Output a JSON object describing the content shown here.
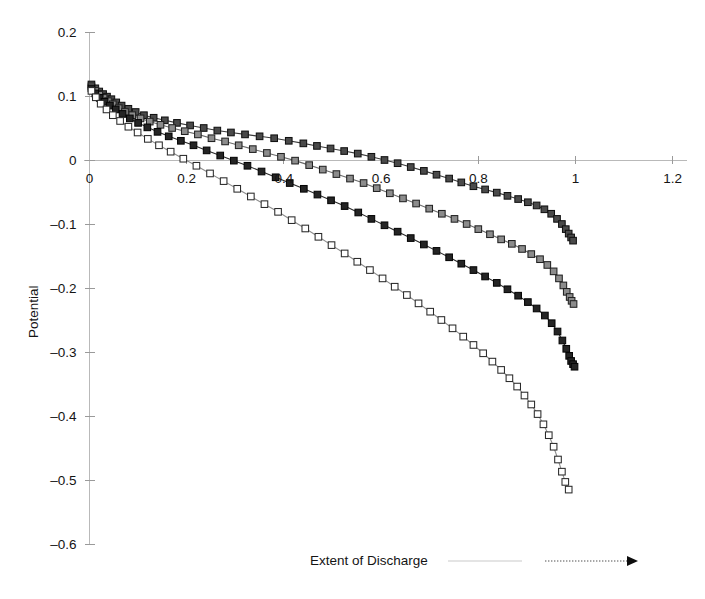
{
  "figure": {
    "background": "#ffffff",
    "axis_color": "#b9b9b9",
    "text_color": "#141414"
  },
  "axis_titles": {
    "ylabel": "Potential",
    "xlabel_annotation": "Extent of Discharge"
  },
  "chart_data": {
    "type": "line",
    "title": "",
    "xlabel": "Extent of Discharge",
    "ylabel": "Potential",
    "xlim": [
      -0.01,
      1.23
    ],
    "ylim": [
      -0.6,
      0.2
    ],
    "xticks": [
      0,
      0.2,
      0.4,
      0.6,
      0.8,
      1,
      1.2
    ],
    "xticklabels": [
      "0",
      "0.2",
      "0.4",
      "0.6",
      "0.8",
      "1",
      "1.2"
    ],
    "yticks": [
      0.2,
      0.1,
      0,
      -0.1,
      -0.2,
      -0.3,
      -0.4,
      -0.5,
      -0.6
    ],
    "yticklabels": [
      "0.2",
      "0.1",
      "0",
      "-0.1",
      "-0.2",
      "-0.3",
      "-0.4",
      "-0.5",
      "-0.6"
    ],
    "grid": false,
    "legend": null,
    "annotations": [
      {
        "text": "Extent of Discharge",
        "x": 0.48,
        "y": -0.61,
        "type": "axis-annotation"
      },
      {
        "text": "arrow pointing right",
        "type": "arrow",
        "from_x": 0.72,
        "to_x": 1.0,
        "y": -0.615
      }
    ],
    "marker": "square",
    "series": [
      {
        "name": "Series 1",
        "marker_fill": "#4a4a4a",
        "marker_edge": "#111111",
        "line_color": "#3a3a3a",
        "x": [
          0.004,
          0.012,
          0.02,
          0.028,
          0.036,
          0.045,
          0.055,
          0.066,
          0.08,
          0.095,
          0.112,
          0.132,
          0.155,
          0.18,
          0.207,
          0.235,
          0.263,
          0.291,
          0.32,
          0.35,
          0.38,
          0.41,
          0.44,
          0.468,
          0.496,
          0.524,
          0.552,
          0.58,
          0.607,
          0.634,
          0.661,
          0.688,
          0.714,
          0.74,
          0.765,
          0.79,
          0.814,
          0.838,
          0.86,
          0.882,
          0.902,
          0.92,
          0.936,
          0.95,
          0.962,
          0.972,
          0.98,
          0.986,
          0.991,
          0.995
        ],
        "y": [
          0.118,
          0.112,
          0.107,
          0.103,
          0.099,
          0.095,
          0.09,
          0.085,
          0.08,
          0.075,
          0.07,
          0.066,
          0.062,
          0.058,
          0.054,
          0.05,
          0.046,
          0.043,
          0.04,
          0.037,
          0.034,
          0.03,
          0.026,
          0.022,
          0.018,
          0.014,
          0.01,
          0.005,
          0.0,
          -0.005,
          -0.011,
          -0.017,
          -0.023,
          -0.029,
          -0.035,
          -0.041,
          -0.046,
          -0.051,
          -0.056,
          -0.061,
          -0.066,
          -0.071,
          -0.077,
          -0.084,
          -0.092,
          -0.1,
          -0.108,
          -0.115,
          -0.121,
          -0.126
        ]
      },
      {
        "name": "Series 2",
        "marker_fill": "#8c8c8c",
        "marker_edge": "#222222",
        "line_color": "#6a6a6a",
        "x": [
          0.004,
          0.012,
          0.02,
          0.029,
          0.038,
          0.048,
          0.06,
          0.073,
          0.088,
          0.105,
          0.124,
          0.146,
          0.17,
          0.196,
          0.223,
          0.251,
          0.279,
          0.307,
          0.336,
          0.365,
          0.394,
          0.423,
          0.452,
          0.48,
          0.508,
          0.536,
          0.564,
          0.591,
          0.618,
          0.645,
          0.672,
          0.699,
          0.725,
          0.751,
          0.776,
          0.8,
          0.824,
          0.847,
          0.869,
          0.89,
          0.909,
          0.927,
          0.942,
          0.955,
          0.966,
          0.975,
          0.982,
          0.988,
          0.992,
          0.996
        ],
        "y": [
          0.115,
          0.108,
          0.102,
          0.097,
          0.092,
          0.087,
          0.081,
          0.075,
          0.07,
          0.065,
          0.06,
          0.055,
          0.05,
          0.045,
          0.04,
          0.034,
          0.029,
          0.023,
          0.017,
          0.011,
          0.005,
          -0.001,
          -0.008,
          -0.015,
          -0.022,
          -0.029,
          -0.036,
          -0.044,
          -0.052,
          -0.06,
          -0.068,
          -0.076,
          -0.084,
          -0.092,
          -0.1,
          -0.108,
          -0.116,
          -0.124,
          -0.131,
          -0.139,
          -0.147,
          -0.155,
          -0.164,
          -0.174,
          -0.185,
          -0.196,
          -0.206,
          -0.214,
          -0.22,
          -0.225
        ]
      },
      {
        "name": "Series 3",
        "marker_fill": "#242424",
        "marker_edge": "#050505",
        "line_color": "#2a2a2a",
        "x": [
          0.004,
          0.012,
          0.021,
          0.031,
          0.042,
          0.054,
          0.068,
          0.083,
          0.1,
          0.119,
          0.14,
          0.163,
          0.188,
          0.214,
          0.241,
          0.269,
          0.297,
          0.325,
          0.354,
          0.383,
          0.412,
          0.441,
          0.469,
          0.497,
          0.525,
          0.553,
          0.58,
          0.607,
          0.634,
          0.661,
          0.688,
          0.714,
          0.74,
          0.765,
          0.79,
          0.814,
          0.838,
          0.86,
          0.882,
          0.902,
          0.92,
          0.937,
          0.951,
          0.963,
          0.973,
          0.981,
          0.987,
          0.991,
          0.995,
          0.998
        ],
        "y": [
          0.112,
          0.104,
          0.097,
          0.091,
          0.085,
          0.079,
          0.072,
          0.065,
          0.058,
          0.051,
          0.044,
          0.037,
          0.03,
          0.023,
          0.015,
          0.007,
          -0.001,
          -0.009,
          -0.018,
          -0.027,
          -0.036,
          -0.045,
          -0.054,
          -0.063,
          -0.072,
          -0.082,
          -0.092,
          -0.102,
          -0.112,
          -0.122,
          -0.132,
          -0.142,
          -0.152,
          -0.162,
          -0.172,
          -0.182,
          -0.192,
          -0.202,
          -0.212,
          -0.222,
          -0.232,
          -0.243,
          -0.255,
          -0.268,
          -0.282,
          -0.295,
          -0.306,
          -0.314,
          -0.319,
          -0.323
        ]
      },
      {
        "name": "Series 4",
        "marker_fill": "#ffffff",
        "marker_edge": "#2a2a2a",
        "line_color": "#8d8d8d",
        "x": [
          0.004,
          0.013,
          0.023,
          0.035,
          0.048,
          0.063,
          0.08,
          0.099,
          0.12,
          0.143,
          0.167,
          0.193,
          0.22,
          0.248,
          0.276,
          0.304,
          0.332,
          0.36,
          0.388,
          0.416,
          0.444,
          0.471,
          0.498,
          0.525,
          0.551,
          0.577,
          0.603,
          0.628,
          0.653,
          0.677,
          0.701,
          0.724,
          0.747,
          0.769,
          0.79,
          0.81,
          0.829,
          0.847,
          0.864,
          0.88,
          0.895,
          0.909,
          0.922,
          0.934,
          0.945,
          0.955,
          0.964,
          0.972,
          0.979,
          0.986
        ],
        "y": [
          0.108,
          0.098,
          0.088,
          0.079,
          0.07,
          0.061,
          0.052,
          0.043,
          0.033,
          0.023,
          0.013,
          0.002,
          -0.009,
          -0.021,
          -0.033,
          -0.045,
          -0.057,
          -0.069,
          -0.081,
          -0.094,
          -0.107,
          -0.12,
          -0.133,
          -0.146,
          -0.159,
          -0.172,
          -0.185,
          -0.198,
          -0.211,
          -0.224,
          -0.237,
          -0.25,
          -0.263,
          -0.276,
          -0.289,
          -0.302,
          -0.315,
          -0.328,
          -0.341,
          -0.354,
          -0.368,
          -0.382,
          -0.397,
          -0.413,
          -0.43,
          -0.448,
          -0.468,
          -0.487,
          -0.503,
          -0.515
        ]
      }
    ]
  }
}
